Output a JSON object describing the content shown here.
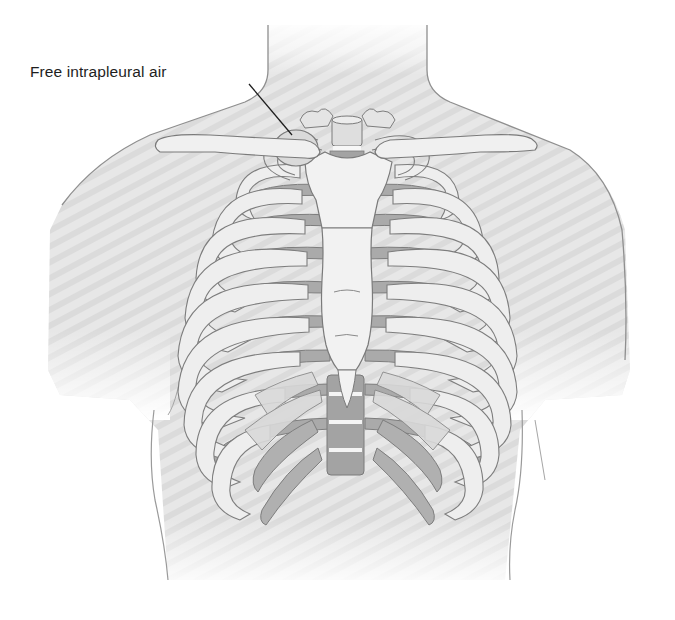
{
  "figure": {
    "annotations": [
      {
        "text": "Free intrapleural air",
        "label_position": {
          "x": 30,
          "y": 63
        },
        "leader_line": {
          "from": [
            249,
            84
          ],
          "to": [
            292,
            135
          ]
        },
        "target": "right lung apex (viewer's left)"
      }
    ],
    "colors": {
      "background": "#ffffff",
      "skin_fill": "#e6e6e6",
      "skin_stripe": "#dcdcdc",
      "outline": "#8c8c8c",
      "bone_light": "#f0f0f0",
      "bone_shadow": "#a9a9a9",
      "bone_outline": "#7d7d7d",
      "label_text": "#1e1e1e"
    }
  }
}
